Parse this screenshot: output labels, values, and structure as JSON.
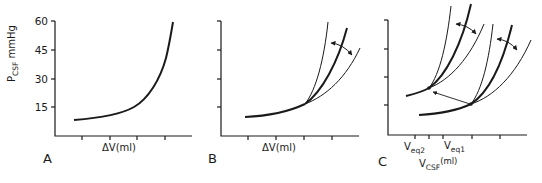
{
  "figure": {
    "y_axis_label_main": "P",
    "y_axis_label_sub": "CSF",
    "y_axis_label_unit": " mmHg",
    "y_ticks": [
      "60",
      "45",
      "30",
      "15"
    ],
    "panels": [
      {
        "letter": "A",
        "x_label": "ΔV(ml)",
        "description": "Single pressure-volume curve, exponential rise"
      },
      {
        "letter": "B",
        "x_label": "ΔV(ml)",
        "description": "Family of pressure-volume curves diverging from common point; double-headed arrow indicates change in elastance"
      },
      {
        "letter": "C",
        "x_label_main": "V",
        "x_label_sub": "CSF",
        "x_label_unit": "(ml)",
        "veq2_main": "V",
        "veq2_sub": "eq2",
        "veq1_main": "V",
        "veq1_sub": "eq1",
        "description": "Two families of curves at equilibrium volumes Veq1 and Veq2; arrow shows shift from Veq1 to Veq2"
      }
    ],
    "colors": {
      "ink": "#1a1a1a",
      "background": "#ffffff"
    }
  }
}
